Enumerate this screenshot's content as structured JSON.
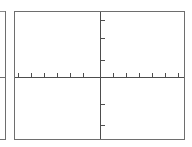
{
  "figure": {
    "background_color": "#ffffff",
    "line_color": "#6e6e6e",
    "axis_color": "#4d4d4d"
  },
  "neighbor_panel": {
    "label": "cropped-adjacent-panel",
    "visible_fraction": "right edge only",
    "has_x_axis": true,
    "x_axis_y_fraction": 0.512
  },
  "chart_data": {
    "type": "scatter",
    "title": "",
    "subtitle": "",
    "xlabel": "",
    "ylabel": "",
    "grid": false,
    "legend": null,
    "legend_position": "none",
    "annotations": [],
    "series": [
      {
        "name": "",
        "x": [],
        "y": []
      }
    ],
    "x": [],
    "values": [],
    "categories": [],
    "xlim": [
      -5,
      9
    ],
    "ylim": [
      -4,
      4
    ],
    "x_axis_position": 0,
    "y_axis_position": 0,
    "xticks": [
      -4,
      -3,
      -2,
      -1,
      0,
      1,
      2,
      3,
      4,
      5,
      6,
      7,
      8
    ],
    "xticklabels": [
      "",
      "",
      "",
      "",
      "",
      "",
      "",
      "",
      "",
      "",
      "",
      "",
      ""
    ],
    "yticks": [
      -2,
      -1,
      1,
      2,
      3
    ],
    "yticklabels": [
      "",
      "",
      "",
      "",
      ""
    ],
    "xtick_positions_pct": [
      2.0,
      9.6,
      17.3,
      25.0,
      32.7,
      40.4,
      50.3,
      58.0,
      65.7,
      73.4,
      81.1,
      88.8,
      96.5
    ],
    "ytick_positions_pct": [
      20.2,
      38.0,
      72.8,
      89.0,
      6.2
    ],
    "xaxis_y_pct": 51.2,
    "yaxis_x_pct": 50.3,
    "tick_direction": "in",
    "tick_length_px": 4,
    "frame": "box"
  }
}
